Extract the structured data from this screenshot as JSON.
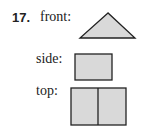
{
  "problem": {
    "number": "17.",
    "views": [
      {
        "label": "front:",
        "shape": "triangle"
      },
      {
        "label": "side:",
        "shape": "rectangle"
      },
      {
        "label": "top:",
        "shape": "two-square-rectangle"
      }
    ],
    "fill_color": "#d9d9d9",
    "stroke_color": "#222222"
  }
}
